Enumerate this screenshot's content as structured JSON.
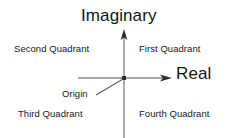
{
  "diagram": {
    "axes": {
      "vertical_label": "Imaginary",
      "horizontal_label": "Real"
    },
    "origin": {
      "label": "Origin"
    },
    "quadrants": [
      {
        "key": "first",
        "label": "First Quadrant"
      },
      {
        "key": "second",
        "label": "Second Quadrant"
      },
      {
        "key": "third",
        "label": "Third Quadrant"
      },
      {
        "key": "fourth",
        "label": "Fourth Quadrant"
      }
    ],
    "colors": {
      "background": "#ffffff",
      "axis_line": "#808080",
      "arrow_head": "#333333",
      "text": "#1c1c1c"
    }
  }
}
